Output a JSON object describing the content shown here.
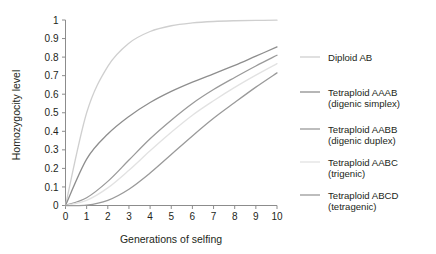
{
  "chart_data": {
    "type": "line",
    "title": "",
    "xlabel": "Generations of selfing",
    "ylabel": "Homozygocity level",
    "xlim": [
      0,
      10
    ],
    "ylim": [
      0,
      1
    ],
    "grid": false,
    "legend_position": "right",
    "x": [
      0,
      1,
      2,
      3,
      4,
      5,
      6,
      7,
      8,
      9,
      10
    ],
    "xticks": [
      "0",
      "1",
      "2",
      "3",
      "4",
      "5",
      "6",
      "7",
      "8",
      "9",
      "10"
    ],
    "yticks": [
      "0",
      "0.1",
      "0.2",
      "0.3",
      "0.4",
      "0.5",
      "0.6",
      "0.7",
      "0.8",
      "0.9",
      "1"
    ],
    "series": [
      {
        "name": "Diploid AB",
        "color": "#cfcfcf",
        "values": [
          0,
          0.5,
          0.75,
          0.875,
          0.938,
          0.969,
          0.984,
          0.992,
          0.996,
          0.998,
          0.999
        ]
      },
      {
        "name": "Tetraploid AAAB (digenic simplex)",
        "color": "#8e8e8e",
        "values": [
          0,
          0.25,
          0.385,
          0.48,
          0.555,
          0.615,
          0.665,
          0.71,
          0.755,
          0.805,
          0.855
        ]
      },
      {
        "name": "Tetraploid AABB (digenic duplex)",
        "color": "#9a9a9a",
        "values": [
          0,
          0.042,
          0.13,
          0.245,
          0.36,
          0.46,
          0.55,
          0.625,
          0.69,
          0.752,
          0.81
        ]
      },
      {
        "name": "Tetraploid AABC (trigenic)",
        "color": "#e2e2e2",
        "values": [
          0,
          0.028,
          0.095,
          0.19,
          0.295,
          0.395,
          0.487,
          0.565,
          0.637,
          0.703,
          0.765
        ]
      },
      {
        "name": "Tetraploid ABCD (tetragenic)",
        "color": "#9a9a9a",
        "values": [
          0,
          0.002,
          0.028,
          0.088,
          0.175,
          0.275,
          0.375,
          0.47,
          0.555,
          0.638,
          0.715
        ]
      }
    ]
  },
  "legend": {
    "entries": [
      {
        "line1": "Diploid AB",
        "line2": "",
        "color": "#cfcfcf"
      },
      {
        "line1": "Tetraploid AAAB",
        "line2": "(digenic simplex)",
        "color": "#8e8e8e"
      },
      {
        "line1": "Tetraploid AABB",
        "line2": "(digenic duplex)",
        "color": "#9a9a9a"
      },
      {
        "line1": "Tetraploid AABC",
        "line2": "(trigenic)",
        "color": "#e2e2e2"
      },
      {
        "line1": "Tetraploid ABCD",
        "line2": "(tetragenic)",
        "color": "#9a9a9a"
      }
    ]
  }
}
